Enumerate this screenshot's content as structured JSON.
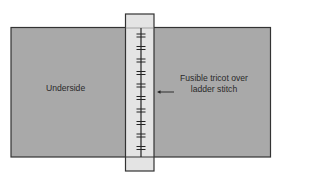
{
  "diagram": {
    "labels": {
      "underside": "Underside",
      "tricot_line1": "Fusible tricot over",
      "tricot_line2": "ladder stitch"
    },
    "colors": {
      "fabric": "#a9a9a9",
      "tricot_strip": "#e4e4e4",
      "outline": "#333333",
      "stitch": "#222222"
    },
    "stitch_count": 10
  }
}
